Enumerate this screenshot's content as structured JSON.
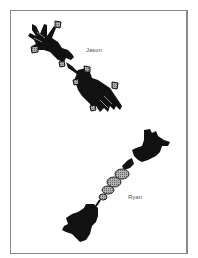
{
  "figure": {
    "labels": {
      "top": "Jason",
      "bottom": "Ryan"
    },
    "colors": {
      "silhouette": "#111111",
      "pattern": "#9a9a9a",
      "frame": "#8a8a8a",
      "background": "#ffffff"
    }
  }
}
